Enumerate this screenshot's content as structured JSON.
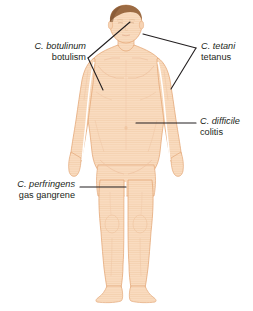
{
  "figure": {
    "background_color": "#ffffff"
  },
  "colors": {
    "skin_fill": "#f9dcc0",
    "skin_shade": "#f0c6a2",
    "skin_outline": "#e4a878",
    "hair": "#9c6b43",
    "hair_shadow": "#7e5230",
    "leader_line": "#231f20",
    "text": "#231f20"
  },
  "labels": [
    {
      "id": "botulinum",
      "species": "C. botulinum",
      "disease": "botulism",
      "align": "right",
      "targets": [
        "head",
        "left-arm"
      ]
    },
    {
      "id": "tetani",
      "species": "C. tetani",
      "disease": "tetanus",
      "align": "left",
      "targets": [
        "jaw",
        "right-arm"
      ]
    },
    {
      "id": "difficile",
      "species": "C. difficile",
      "disease": "colitis",
      "align": "left",
      "targets": [
        "abdomen"
      ]
    },
    {
      "id": "perfringens",
      "species": "C. perfringens",
      "disease": "gas gangrene",
      "align": "right",
      "targets": [
        "thigh"
      ]
    }
  ]
}
